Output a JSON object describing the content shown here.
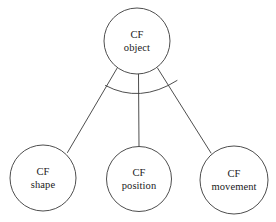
{
  "diagram": {
    "type": "taxonomy-tree",
    "background_color": "#ffffff",
    "stroke_color": "#3a3a3a",
    "text_color": "#1a1a1a",
    "nodes": [
      {
        "id": "cf-object",
        "role": "root",
        "line1": "CF",
        "line2": "object",
        "cx": 137,
        "cy": 41,
        "r": 33
      },
      {
        "id": "cf-shape",
        "role": "child",
        "line1": "CF",
        "line2": "shape",
        "cx": 43,
        "cy": 178,
        "r": 33
      },
      {
        "id": "cf-position",
        "role": "child",
        "line1": "CF",
        "line2": "position",
        "cx": 139,
        "cy": 179,
        "r": 32.5
      },
      {
        "id": "cf-movement",
        "role": "child",
        "line1": "CF",
        "line2": "movement",
        "cx": 234,
        "cy": 180,
        "r": 34
      }
    ],
    "edges": [
      {
        "id": "edge-object-shape",
        "from": "cf-object",
        "to": "cf-shape",
        "path": "M 117.5 67.5 L 67.5 152.5"
      },
      {
        "id": "edge-object-position",
        "from": "cf-object",
        "to": "cf-position",
        "path": "M 138.5 74 L 139 146.5"
      },
      {
        "id": "edge-object-movement",
        "from": "cf-object",
        "to": "cf-movement",
        "path": "M 157.5 68 L 211 153"
      }
    ],
    "generalization_arc": {
      "id": "generalization-set-arc",
      "path": "M 105.5 85.5 Q 140 104 177 80.5"
    }
  }
}
